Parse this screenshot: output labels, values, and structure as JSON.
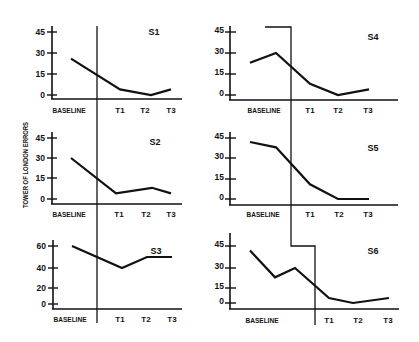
{
  "figure": {
    "y_axis_title": "TOWER OF LONDON ERRORS"
  },
  "chart_data": {
    "type": "line",
    "title": "",
    "xlabel": "",
    "ylabel": "TOWER OF LONDON ERRORS",
    "grid": false,
    "legend": "none",
    "layout": "3 rows x 2 columns small multiples; vertical phase-change lines separate BASELINE from treatment sessions T1-T3",
    "panels": [
      {
        "title": "S1",
        "categories": [
          "BASELINE",
          "T1",
          "T2",
          "T3"
        ],
        "yticks": [
          "0",
          "15",
          "30",
          "45"
        ],
        "ylim": [
          0,
          45
        ],
        "baseline": [
          26
        ],
        "treatment": {
          "T1": 4,
          "T2": 0,
          "T3": 4
        },
        "values": [
          26,
          4,
          0,
          4
        ]
      },
      {
        "title": "S2",
        "categories": [
          "BASELINE",
          "T1",
          "T2",
          "T3"
        ],
        "yticks": [
          "0",
          "15",
          "30",
          "45"
        ],
        "ylim": [
          0,
          45
        ],
        "baseline": [
          30
        ],
        "treatment": {
          "T1": 4,
          "T2": 8,
          "T3": 4
        },
        "values": [
          30,
          4,
          8,
          4
        ]
      },
      {
        "title": "S3",
        "categories": [
          "BASELINE",
          "T1",
          "T2",
          "T3"
        ],
        "yticks": [
          "0",
          "20",
          "40",
          "60"
        ],
        "ylim": [
          0,
          60
        ],
        "baseline": [
          60
        ],
        "treatment": {
          "T1": 40,
          "T2": 50,
          "T3": 50
        },
        "values": [
          60,
          40,
          50,
          50
        ]
      },
      {
        "title": "S4",
        "categories": [
          "BASELINE",
          "T1",
          "T2",
          "T3"
        ],
        "yticks": [
          "0",
          "15",
          "30",
          "45"
        ],
        "ylim": [
          0,
          45
        ],
        "baseline": [
          23,
          30
        ],
        "treatment": {
          "T1": 8,
          "T2": 0,
          "T3": 4
        },
        "values": [
          23,
          30,
          8,
          0,
          4
        ]
      },
      {
        "title": "S5",
        "categories": [
          "BASELINE",
          "T1",
          "T2",
          "T3"
        ],
        "yticks": [
          "0",
          "15",
          "30",
          "45"
        ],
        "ylim": [
          0,
          45
        ],
        "baseline": [
          42,
          38
        ],
        "treatment": {
          "T1": 11,
          "T2": 0,
          "T3": 0
        },
        "values": [
          42,
          38,
          11,
          0,
          0
        ]
      },
      {
        "title": "S6",
        "categories": [
          "BASELINE",
          "T1",
          "T2",
          "T3"
        ],
        "yticks": [
          "0",
          "15",
          "30",
          "45"
        ],
        "ylim": [
          0,
          45
        ],
        "baseline": [
          42,
          23,
          30
        ],
        "treatment": {
          "T1": 5,
          "T2": 0,
          "T3": 5
        },
        "values": [
          42,
          23,
          30,
          5,
          0,
          5
        ]
      }
    ]
  }
}
